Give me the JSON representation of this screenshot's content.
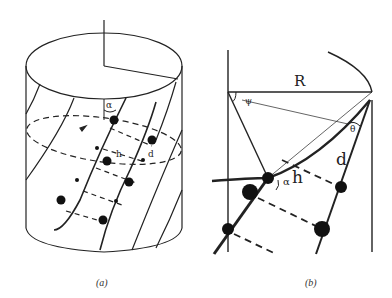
{
  "figure": {
    "panel_a": {
      "caption": "(a)",
      "labels": {
        "alpha": "α",
        "h": "h",
        "d": "d"
      }
    },
    "panel_b": {
      "caption": "(b)",
      "labels": {
        "R": "R",
        "psi": "ψ",
        "theta": "θ",
        "alpha": "α",
        "d": "d",
        "h": "h"
      }
    },
    "colors": {
      "line": "#222222",
      "background": "#ffffff"
    }
  }
}
